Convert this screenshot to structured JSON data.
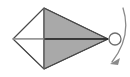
{
  "figure": {
    "background_color": "#ffffff",
    "width": 130,
    "height": 77,
    "solid": {
      "name": "bipyramid",
      "vertices": {
        "left_apex": [
          13,
          39
        ],
        "top": [
          44,
          8
        ],
        "bottom": [
          44,
          69
        ],
        "right_apex": [
          108,
          39
        ]
      },
      "faces": [
        {
          "name": "upper-right-face",
          "points": "44,8 108,39 44,39",
          "fill": "#a9a9a9",
          "stroke": "#4a4a4a"
        },
        {
          "name": "lower-right-face",
          "points": "44,69 108,39 44,39",
          "fill": "#a9a9a9",
          "stroke": "#4a4a4a"
        },
        {
          "name": "upper-left-face",
          "points": "13,39 44,8 44,39",
          "fill": "#ffffff",
          "stroke": "#4a4a4a"
        },
        {
          "name": "lower-left-face",
          "points": "13,39 44,69 44,39",
          "fill": "#ffffff",
          "stroke": "#4a4a4a"
        }
      ],
      "axis_line": {
        "name": "horizontal-axis",
        "from": [
          13,
          39
        ],
        "to": [
          108,
          39
        ],
        "left_color": "#b9b9b9",
        "right_color": "#2a2a2a"
      },
      "outline_color": "#4a4a4a",
      "fill_color": "#a9a9a9"
    },
    "rotation_indicator": {
      "name": "rotation-arrow",
      "axis_marker": {
        "name": "axis-point-circle",
        "center": [
          115,
          39
        ],
        "radius": 6,
        "stroke": "#6e6e6e",
        "fill": "#ffffff"
      },
      "arc": {
        "name": "curved-arrow-arc",
        "start": [
          123,
          8
        ],
        "control": [
          131,
          39
        ],
        "end": [
          112,
          63
        ],
        "stroke": "#8a8a8a"
      },
      "arrowhead": {
        "name": "arrowhead",
        "points": "112,63 119,58 117,64",
        "fill": "#8a8a8a"
      },
      "direction": "clockwise-about-horizontal-axis"
    }
  }
}
